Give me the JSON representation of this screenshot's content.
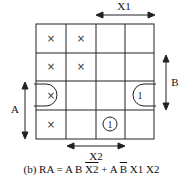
{
  "kmap": {
    "rows": 4,
    "cols": 4,
    "cells": [
      [
        "×",
        "×",
        "",
        ""
      ],
      [
        "×",
        "×",
        "",
        ""
      ],
      [
        "×",
        "",
        "",
        "1"
      ],
      [
        "×",
        "",
        "1",
        ""
      ]
    ],
    "labels": {
      "x1": "X1",
      "x2": "X2",
      "a": "A",
      "b": "B"
    }
  },
  "caption": {
    "prefix": "(b) RA = A B ",
    "term1_bar": "X2",
    "mid": " + A ",
    "term2_bar": "B",
    "suffix": " X1 X2"
  }
}
